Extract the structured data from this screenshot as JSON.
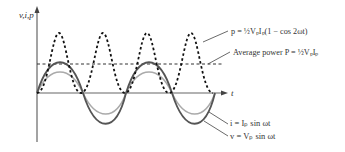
{
  "axes": {
    "y_label": "v,i,p",
    "x_label": "t"
  },
  "labels": {
    "instant_power": "p = ½VₚIₚ(1 − cos 2ωt)",
    "average_power": "Average power P = ½VₚIₚ",
    "current": "i = Iₚ sin ωt",
    "voltage": "v = Vₚ sin ωt"
  },
  "colors": {
    "voltage": "#555555",
    "current": "#aaaaaa",
    "power": "#111111",
    "average": "#333333",
    "axis": "#666666"
  }
}
